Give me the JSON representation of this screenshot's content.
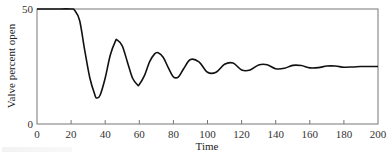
{
  "chart_data": {
    "type": "line",
    "title": "",
    "xlabel": "Time",
    "ylabel": "Valve percent open",
    "xlim": [
      0,
      200
    ],
    "ylim": [
      0,
      50
    ],
    "x_ticks": [
      0,
      20,
      40,
      60,
      80,
      100,
      120,
      140,
      160,
      180,
      200
    ],
    "y_ticks": [
      0,
      50
    ],
    "grid": false,
    "legend": null,
    "series": [
      {
        "name": "Valve percent open",
        "x": [
          0,
          10,
          20,
          22,
          25,
          28,
          31,
          34,
          35,
          37,
          40,
          43,
          46,
          47,
          50,
          53,
          56,
          59,
          60,
          63,
          66,
          69,
          71,
          74,
          77,
          80,
          83,
          86,
          90,
          95,
          100,
          105,
          110,
          115,
          120,
          125,
          130,
          135,
          140,
          145,
          150,
          155,
          160,
          165,
          170,
          175,
          180,
          185,
          190,
          195,
          200
        ],
        "y": [
          50,
          50,
          50,
          49.5,
          45,
          32,
          20,
          12.5,
          11.3,
          12.5,
          20,
          30,
          36,
          36.5,
          34,
          27,
          20,
          17,
          17.2,
          21,
          27,
          30.5,
          31,
          29,
          24.5,
          20.5,
          20.5,
          24,
          28,
          27,
          22.5,
          22.5,
          26,
          26.5,
          23.5,
          23.5,
          25.7,
          25.8,
          24,
          24.2,
          25.5,
          25.4,
          24.4,
          24.5,
          25.2,
          25.2,
          24.7,
          24.8,
          25,
          25,
          25
        ]
      }
    ]
  },
  "axes": {
    "x_tick_labels": [
      "0",
      "20",
      "40",
      "60",
      "80",
      "100",
      "120",
      "140",
      "160",
      "180",
      "200"
    ],
    "y_tick_labels": [
      "0",
      "50"
    ],
    "xlabel": "Time",
    "ylabel": "Valve percent open"
  },
  "colors": {
    "line": "#111111",
    "frame": "#777777",
    "background": "#ffffff"
  }
}
